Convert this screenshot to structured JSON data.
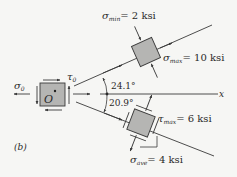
{
  "figure": {
    "panel_label": "(b)",
    "axis_label": "x",
    "origin_element": {
      "label": "O",
      "stress_normal": "σ",
      "stress_normal_sub": "0",
      "stress_shear": "τ",
      "stress_shear_sub": "0"
    },
    "principal_element": {
      "angle": "24.1°",
      "sigma_min": {
        "symbol": "σ",
        "sub": "min",
        "value": "= 2 ksi"
      },
      "sigma_max": {
        "symbol": "σ",
        "sub": "max",
        "value": "= 10 ksi"
      }
    },
    "max_shear_element": {
      "angle": "20.9°",
      "tau_max": {
        "symbol": "τ",
        "sub": "max",
        "value": "= 6 ksi"
      },
      "sigma_ave": {
        "symbol": "σ",
        "sub": "ave",
        "value": "= 4 ksi"
      }
    },
    "colors": {
      "element_fill": "#b5b5b3",
      "line": "#3a3a3a",
      "background": "#f6f6f4"
    }
  }
}
